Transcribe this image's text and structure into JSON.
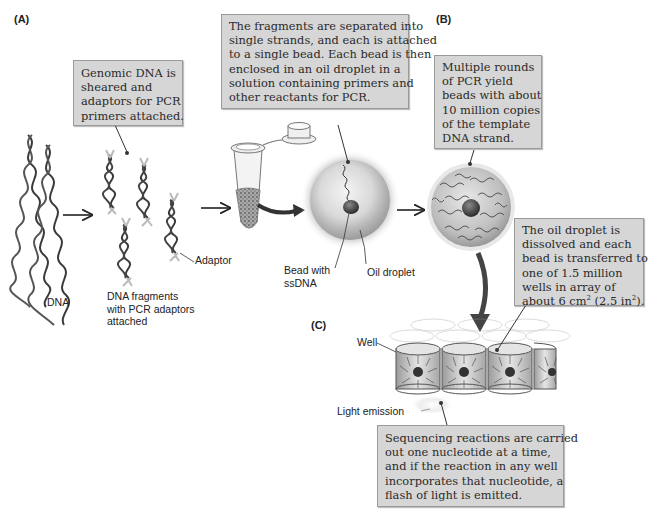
{
  "figure": {
    "panels": {
      "a": "(A)",
      "b": "(B)",
      "c": "(C)"
    },
    "callouts": {
      "genomic": {
        "lines": [
          "Genomic DNA is",
          "sheared and",
          "adaptors for PCR",
          "primers attached."
        ]
      },
      "fragments": {
        "lines": [
          "The fragments are separated into",
          "single strands, and each is attached",
          "to a single bead. Each bead is then",
          "enclosed in an oil droplet in a",
          "solution containing primers and",
          "other reactants for PCR."
        ]
      },
      "pcr": {
        "lines": [
          "Multiple rounds",
          "of PCR yield",
          "beads with about",
          "10 million copies",
          "of the template",
          "DNA strand."
        ]
      },
      "wells": {
        "lines": [
          "The oil droplet is",
          "dissolved and each",
          "bead is transferred to",
          "one of 1.5 million",
          "wells in array of"
        ],
        "last_prefix": "about 6 cm",
        "last_sup1": "2",
        "last_mid": " (2.5 in",
        "last_sup2": "2",
        "last_suffix": ")."
      },
      "sequencing": {
        "lines": [
          "Sequencing reactions are carried",
          "out one nucleotide at a time,",
          "and if the reaction in any well",
          "incorporates that nucleotide, a",
          "flash of light is emitted."
        ]
      }
    },
    "labels": {
      "dna": "DNA",
      "fragments": [
        "DNA fragments",
        "with PCR adaptors",
        "attached"
      ],
      "adaptor": "Adaptor",
      "bead": [
        "Bead with",
        "ssDNA"
      ],
      "oil": "Oil droplet",
      "well": "Well",
      "light": "Light emission"
    },
    "colors": {
      "callout_bg": "#d6d6d6",
      "callout_border": "#9a9a9a",
      "dna_dark": "#3a3a3a",
      "adaptor_light": "#b8b8b8",
      "arrow": "#333333"
    }
  }
}
